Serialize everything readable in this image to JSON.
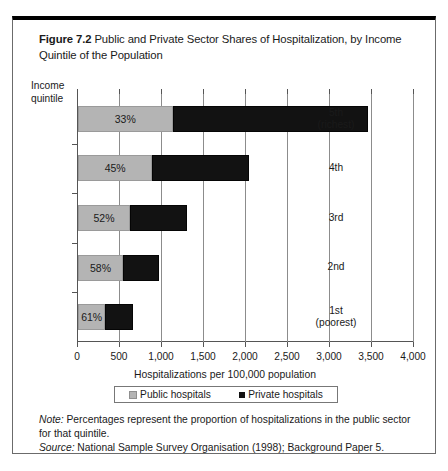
{
  "figure": {
    "label": "Figure 7.2",
    "title": "Public and Private Sector Shares of Hospitalization, by Income Quintile of the Population"
  },
  "y_axis_caption": "Income\nquintile",
  "x_axis_title": "Hospitalizations per 100,000 population",
  "legend": {
    "public_label": "Public hospitals",
    "private_label": "Private hospitals",
    "public_color": "#b4b4b4",
    "private_color": "#121212"
  },
  "notes": {
    "note_lead": "Note:",
    "note_text": " Percentages represent the proportion of hospitalizations in the public sector for that quintile.",
    "source_lead": "Source:",
    "source_text": " National Sample Survey Organisation (1998); Background Paper 5."
  },
  "chart_data": {
    "type": "bar",
    "orientation": "horizontal",
    "stacked": true,
    "title": "Public and Private Sector Shares of Hospitalization, by Income Quintile of the Population",
    "xlabel": "Hospitalizations per 100,000 population",
    "ylabel": "Income quintile",
    "xlim": [
      0,
      4000
    ],
    "xticks": [
      0,
      500,
      1000,
      1500,
      2000,
      2500,
      3000,
      3500,
      4000
    ],
    "xtick_labels": [
      "0",
      "500",
      "1,000",
      "1,500",
      "2,000",
      "2,500",
      "3,000",
      "3,500",
      "4,000"
    ],
    "grid": true,
    "legend_position": "bottom",
    "categories": [
      "5th\n(richest)",
      "4th",
      "3rd",
      "2nd",
      "1st\n(poorest)"
    ],
    "category_labels_plain": [
      "5th (richest)",
      "4th",
      "3rd",
      "2nd",
      "1st (poorest)"
    ],
    "series": [
      {
        "name": "Public hospitals",
        "color": "#b4b4b4",
        "values": [
          1125,
          885,
          620,
          535,
          325
        ]
      },
      {
        "name": "Private hospitals",
        "color": "#121212",
        "values": [
          2325,
          1155,
          675,
          430,
          330
        ]
      }
    ],
    "totals": [
      3450,
      2040,
      1295,
      965,
      655
    ],
    "data_labels": [
      "33%",
      "45%",
      "52%",
      "58%",
      "61%"
    ]
  }
}
